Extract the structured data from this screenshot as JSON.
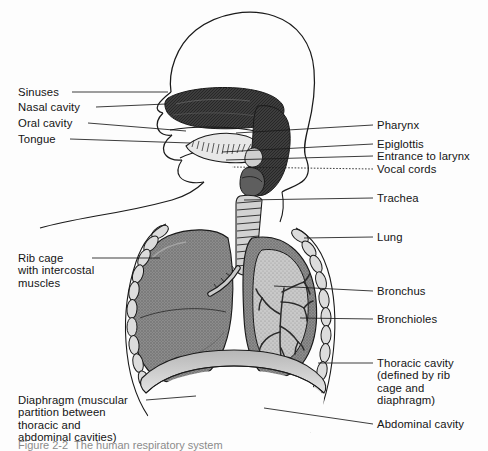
{
  "figure": {
    "caption_partial": "Figure 2-2  The human respiratory system",
    "background_color": "#fdfdfd",
    "ink_color": "#141414"
  },
  "labels_left": [
    {
      "id": "sinuses",
      "text": "Sinuses",
      "x": 18,
      "y": 86,
      "leader": {
        "x1": 72,
        "y1": 92,
        "x2": 168,
        "y2": 92
      }
    },
    {
      "id": "nasal-cavity",
      "text": "Nasal cavity",
      "x": 18,
      "y": 101,
      "leader": {
        "x1": 96,
        "y1": 107,
        "x2": 166,
        "y2": 104
      }
    },
    {
      "id": "oral-cavity",
      "text": "Oral cavity",
      "x": 18,
      "y": 117,
      "leader": {
        "x1": 88,
        "y1": 123,
        "x2": 186,
        "y2": 131
      }
    },
    {
      "id": "tongue",
      "text": "Tongue",
      "x": 18,
      "y": 133,
      "leader": {
        "x1": 70,
        "y1": 139,
        "x2": 190,
        "y2": 143
      }
    },
    {
      "id": "rib-cage",
      "text": "Rib cage\nwith intercostal\nmuscles",
      "x": 18,
      "y": 252,
      "leader": {
        "x1": 92,
        "y1": 258,
        "x2": 160,
        "y2": 258
      }
    },
    {
      "id": "diaphragm",
      "text": "Diaphragm (muscular\npartition between\nthoracic and\nabdominal cavities)",
      "x": 18,
      "y": 394,
      "leader": {
        "x1": 146,
        "y1": 400,
        "x2": 196,
        "y2": 396
      }
    }
  ],
  "labels_right": [
    {
      "id": "pharynx",
      "text": "Pharynx",
      "x": 377,
      "y": 119,
      "leader": {
        "x1": 373,
        "y1": 125,
        "x2": 236,
        "y2": 133
      },
      "dashed": false
    },
    {
      "id": "epiglottis",
      "text": "Epiglottis",
      "x": 377,
      "y": 138,
      "leader": {
        "x1": 373,
        "y1": 144,
        "x2": 222,
        "y2": 152
      },
      "dashed": false
    },
    {
      "id": "entrance-to-larynx",
      "text": "Entrance to larynx",
      "x": 377,
      "y": 150,
      "leader": {
        "x1": 373,
        "y1": 156,
        "x2": 226,
        "y2": 160
      },
      "dashed": false
    },
    {
      "id": "vocal-cords",
      "text": "Vocal cords",
      "x": 377,
      "y": 163,
      "leader": {
        "x1": 373,
        "y1": 169,
        "x2": 232,
        "y2": 167
      },
      "dashed": true
    },
    {
      "id": "trachea",
      "text": "Trachea",
      "x": 377,
      "y": 192,
      "leader": {
        "x1": 373,
        "y1": 198,
        "x2": 244,
        "y2": 200
      },
      "dashed": false
    },
    {
      "id": "lung",
      "text": "Lung",
      "x": 377,
      "y": 231,
      "leader": {
        "x1": 373,
        "y1": 237,
        "x2": 304,
        "y2": 238
      },
      "dashed": false
    },
    {
      "id": "bronchus",
      "text": "Bronchus",
      "x": 377,
      "y": 285,
      "leader": {
        "x1": 373,
        "y1": 291,
        "x2": 274,
        "y2": 286
      },
      "dashed": false
    },
    {
      "id": "bronchioles",
      "text": "Bronchioles",
      "x": 377,
      "y": 313,
      "leader": {
        "x1": 373,
        "y1": 319,
        "x2": 300,
        "y2": 318
      },
      "dashed": false
    },
    {
      "id": "thoracic-cavity",
      "text": "Thoracic cavity\n(defined by rib\ncage and\ndiaphragm)",
      "x": 377,
      "y": 357,
      "leader": {
        "x1": 373,
        "y1": 363,
        "x2": 318,
        "y2": 363
      },
      "dashed": false
    },
    {
      "id": "abdominal-cavity",
      "text": "Abdominal cavity",
      "x": 377,
      "y": 418,
      "leader": {
        "x1": 373,
        "y1": 424,
        "x2": 264,
        "y2": 408
      },
      "dashed": false
    }
  ],
  "anatomy_parts": [
    "head-profile-outline",
    "sinus-nasal-shading",
    "hard-palate",
    "tongue",
    "oral-cavity",
    "pharynx-column",
    "epiglottis",
    "larynx",
    "vocal-cords",
    "trachea-rings",
    "left-bronchus",
    "right-bronchus",
    "bronchial-tree",
    "left-lung",
    "right-lung-cutaway",
    "rib-chain",
    "diaphragm-dome",
    "abdominal-cavity",
    "chest-outline",
    "back-outline"
  ],
  "tones": {
    "lung_fill": "#8f8f8f",
    "lung_cut_fill": "#bdbdbd",
    "dark_tissue": "#3a3a3a",
    "rib_fill": "#d8d8d8",
    "diaphragm_fill": "#cfcfcf",
    "line": "#1a1a1a"
  }
}
